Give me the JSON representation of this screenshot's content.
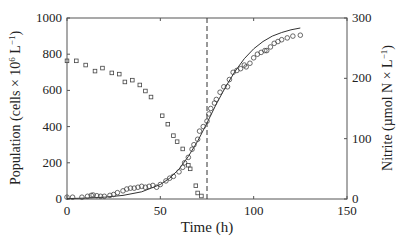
{
  "chart_data": {
    "type": "scatter",
    "title": "",
    "xlabel": "Time (h)",
    "ylabel": "Population (cells × 10^6 L^-1)",
    "ylabel_right": "Nitrite (µmol N × L^-1)",
    "xlim": [
      0,
      150
    ],
    "ylim": [
      0,
      1000
    ],
    "ylim_right": [
      0,
      300
    ],
    "x_ticks": [
      0,
      50,
      100,
      150
    ],
    "y_ticks": [
      0,
      200,
      400,
      600,
      800,
      1000
    ],
    "y_ticks_right": [
      0,
      100,
      200,
      300
    ],
    "grid": false,
    "legend": null,
    "vertical_line": {
      "x": 75,
      "style": "dashed"
    },
    "series": [
      {
        "name": "Population (observed)",
        "axis": "left",
        "marker": "circle",
        "x": [
          0,
          3,
          8,
          11,
          13,
          14,
          16,
          18,
          20,
          23,
          25,
          27,
          30,
          32,
          34,
          36,
          38,
          40,
          42,
          44,
          46,
          48,
          50,
          53,
          55,
          57,
          60,
          62,
          63,
          65,
          67,
          68,
          70,
          71,
          73,
          75,
          76,
          77,
          79,
          80,
          82,
          84,
          86,
          87,
          89,
          91,
          93,
          95,
          96,
          98,
          100,
          102,
          104,
          106,
          107,
          109,
          111,
          113,
          115,
          118,
          121,
          125
        ],
        "y": [
          10,
          10,
          10,
          15,
          20,
          22,
          18,
          15,
          15,
          20,
          25,
          35,
          45,
          55,
          60,
          60,
          65,
          70,
          65,
          70,
          75,
          65,
          80,
          100,
          115,
          125,
          150,
          175,
          200,
          230,
          275,
          300,
          330,
          375,
          400,
          430,
          470,
          500,
          530,
          550,
          590,
          620,
          620,
          660,
          700,
          710,
          720,
          740,
          730,
          750,
          780,
          800,
          810,
          820,
          820,
          840,
          860,
          870,
          880,
          890,
          900,
          905
        ]
      },
      {
        "name": "Nitrite (observed)",
        "axis": "right",
        "marker": "square",
        "x": [
          0,
          5,
          10,
          15,
          19,
          24,
          28,
          31,
          35,
          39,
          42,
          45,
          51,
          54,
          57,
          59,
          62,
          65,
          66,
          69,
          70,
          72
        ],
        "y": [
          229,
          229,
          222,
          212,
          217,
          209,
          207,
          194,
          197,
          189,
          179,
          169,
          138,
          124,
          105,
          95,
          83,
          56,
          50,
          22,
          10,
          5
        ]
      },
      {
        "name": "Population (model fit)",
        "axis": "left",
        "marker": "none",
        "line": "solid",
        "x": [
          0,
          10,
          20,
          30,
          40,
          50,
          55,
          60,
          65,
          70,
          75,
          80,
          85,
          90,
          95,
          100,
          105,
          110,
          115,
          120,
          125
        ],
        "y": [
          2,
          5,
          10,
          20,
          40,
          80,
          115,
          165,
          235,
          320,
          420,
          525,
          620,
          705,
          775,
          830,
          870,
          900,
          920,
          935,
          945
        ]
      }
    ]
  }
}
